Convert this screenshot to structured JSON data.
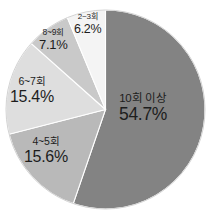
{
  "chart_data": {
    "type": "pie",
    "title": "",
    "subtitle": "",
    "xlabel": "",
    "ylabel": "",
    "legend_position": "none",
    "grid": false,
    "labels_inside": true,
    "unit": "%",
    "categories": [
      "10회 이상",
      "4~5회",
      "6~7회",
      "8~9회",
      "2~3회"
    ],
    "values": [
      54.7,
      15.6,
      15.4,
      7.1,
      6.2
    ],
    "value_labels": [
      "54.7%",
      "15.6%",
      "15.4%",
      "7.1%",
      "6.2%"
    ],
    "colors": [
      "#838383",
      "#b9b9b9",
      "#dedede",
      "#c9c9c9",
      "#f4f4f4"
    ],
    "slices": [
      {
        "name": "10회 이상",
        "value": 54.7,
        "value_label": "54.7%",
        "color": "#838383",
        "start_angle": 0,
        "end_angle": 196.92
      },
      {
        "name": "4~5회",
        "value": 15.6,
        "value_label": "15.6%",
        "color": "#b9b9b9",
        "start_angle": 196.92,
        "end_angle": 253.08
      },
      {
        "name": "6~7회",
        "value": 15.4,
        "value_label": "15.4%",
        "color": "#dedede",
        "start_angle": 253.08,
        "end_angle": 308.52
      },
      {
        "name": "8~9회",
        "value": 7.1,
        "value_label": "7.1%",
        "color": "#c9c9c9",
        "start_angle": 308.52,
        "end_angle": 334.08
      },
      {
        "name": "2~3회",
        "value": 6.2,
        "value_label": "6.2%",
        "color": "#f4f4f4",
        "start_angle": 334.08,
        "end_angle": 356.4
      }
    ]
  },
  "labels": {
    "main": {
      "category": "10회 이상",
      "percent": "54.7%"
    },
    "four_five": {
      "category": "4~5회",
      "percent": "15.6%"
    },
    "six_seven": {
      "category": "6~7회",
      "percent": "15.4%"
    },
    "eight_nine": {
      "category": "8~9회",
      "percent": "7.1%"
    },
    "two_three": {
      "category": "2~3회",
      "percent": "6.2%"
    }
  },
  "style": {
    "background": "#ffffff",
    "text_color": "#1d1d1d",
    "outline_color": "#d2d2d2"
  }
}
